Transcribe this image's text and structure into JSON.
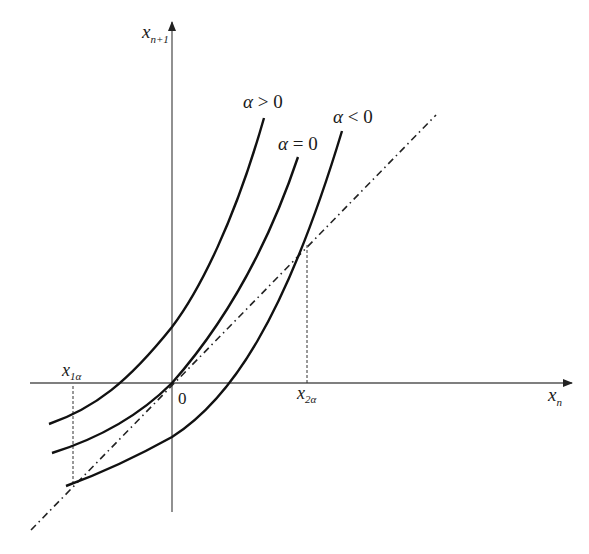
{
  "diagram": {
    "type": "phase-plot / cobweb map",
    "axes": {
      "x_label": "x",
      "x_subscript": "n",
      "y_label": "x",
      "y_subscript": "n+1",
      "origin_label": "0"
    },
    "curves": [
      {
        "id": "alpha-positive",
        "label_greek": "α",
        "label_rel": " > 0"
      },
      {
        "id": "alpha-zero",
        "label_greek": "α",
        "label_rel": " = 0"
      },
      {
        "id": "alpha-negative",
        "label_greek": "α",
        "label_rel": " < 0"
      }
    ],
    "reference_line": "x_{n+1} = x_n (dash-dot diagonal)",
    "fixed_points": [
      {
        "label": "x",
        "subscript": "1α"
      },
      {
        "label": "x",
        "subscript": "2α"
      }
    ]
  },
  "colors": {
    "axis": "#555555",
    "curve": "#111111",
    "text": "#1a1a1a"
  }
}
